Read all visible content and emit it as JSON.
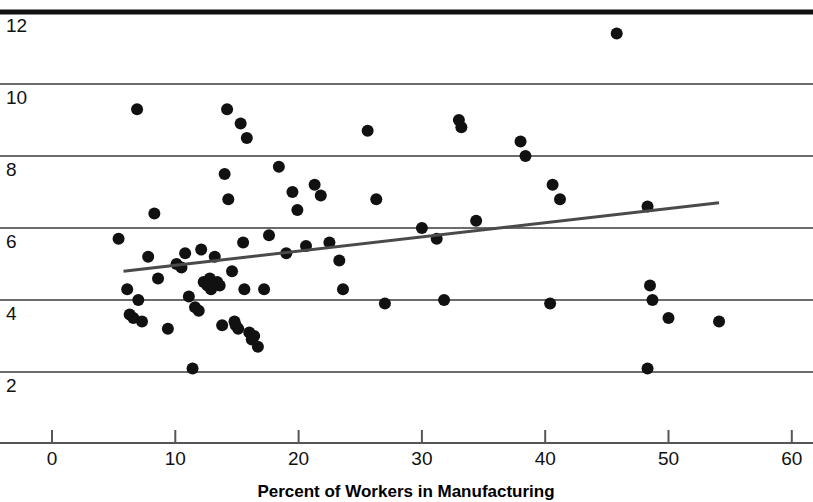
{
  "chart_data": {
    "type": "scatter",
    "title": "",
    "xlabel": "Percent of Workers in Manufacturing",
    "ylabel": "",
    "xlim": [
      -4.2,
      61.9
    ],
    "ylim": [
      1.0,
      12.4
    ],
    "xticks": [
      0,
      10,
      20,
      30,
      40,
      50,
      60
    ],
    "xtick_labels": [
      "0",
      "10",
      "20",
      "30",
      "40",
      "50",
      "60"
    ],
    "yticks": [
      2,
      4,
      6,
      8,
      10,
      12
    ],
    "ytick_labels": [
      "2",
      "4",
      "6",
      "8",
      "10",
      "12"
    ],
    "grid": "horizontal",
    "legend": "none",
    "points": [
      [
        5.4,
        5.7
      ],
      [
        6.1,
        4.3
      ],
      [
        6.3,
        3.6
      ],
      [
        6.6,
        3.5
      ],
      [
        6.9,
        9.3
      ],
      [
        7.0,
        4.0
      ],
      [
        7.3,
        3.4
      ],
      [
        7.8,
        5.2
      ],
      [
        8.3,
        6.4
      ],
      [
        8.6,
        4.6
      ],
      [
        9.4,
        3.2
      ],
      [
        10.1,
        5.0
      ],
      [
        10.5,
        4.9
      ],
      [
        10.8,
        5.3
      ],
      [
        11.1,
        4.1
      ],
      [
        11.4,
        2.1
      ],
      [
        11.6,
        3.8
      ],
      [
        11.9,
        3.7
      ],
      [
        12.1,
        5.4
      ],
      [
        12.3,
        4.5
      ],
      [
        12.6,
        4.4
      ],
      [
        12.8,
        4.6
      ],
      [
        12.9,
        4.3
      ],
      [
        13.2,
        5.2
      ],
      [
        13.4,
        4.5
      ],
      [
        13.6,
        4.4
      ],
      [
        13.8,
        3.3
      ],
      [
        14.0,
        7.5
      ],
      [
        14.2,
        9.3
      ],
      [
        14.3,
        6.8
      ],
      [
        14.6,
        4.8
      ],
      [
        14.8,
        3.4
      ],
      [
        14.9,
        3.3
      ],
      [
        15.1,
        3.2
      ],
      [
        15.3,
        8.9
      ],
      [
        15.5,
        5.6
      ],
      [
        15.6,
        4.3
      ],
      [
        15.8,
        8.5
      ],
      [
        16.0,
        3.1
      ],
      [
        16.2,
        2.9
      ],
      [
        16.4,
        3.0
      ],
      [
        16.7,
        2.7
      ],
      [
        17.2,
        4.3
      ],
      [
        17.6,
        5.8
      ],
      [
        18.4,
        7.7
      ],
      [
        19.0,
        5.3
      ],
      [
        19.5,
        7.0
      ],
      [
        19.9,
        6.5
      ],
      [
        20.6,
        5.5
      ],
      [
        21.3,
        7.2
      ],
      [
        21.8,
        6.9
      ],
      [
        22.5,
        5.6
      ],
      [
        23.3,
        5.1
      ],
      [
        23.6,
        4.3
      ],
      [
        25.6,
        8.7
      ],
      [
        26.3,
        6.8
      ],
      [
        27.0,
        3.9
      ],
      [
        30.0,
        6.0
      ],
      [
        31.2,
        5.7
      ],
      [
        31.8,
        4.0
      ],
      [
        33.0,
        9.0
      ],
      [
        33.2,
        8.8
      ],
      [
        34.4,
        6.2
      ],
      [
        38.0,
        8.4
      ],
      [
        38.4,
        8.0
      ],
      [
        40.4,
        3.9
      ],
      [
        40.6,
        7.2
      ],
      [
        41.2,
        6.8
      ],
      [
        45.8,
        11.4
      ],
      [
        48.3,
        6.6
      ],
      [
        48.5,
        4.4
      ],
      [
        48.7,
        4.0
      ],
      [
        48.3,
        2.1
      ],
      [
        50.0,
        3.5
      ],
      [
        54.1,
        3.4
      ]
    ],
    "trend_line": {
      "x0": 5.8,
      "y0": 4.8,
      "x1": 54.1,
      "y1": 6.7
    }
  },
  "style": {
    "point_color": "#111111",
    "grid_color": "#3a3a3a",
    "top_bar_color": "#111111",
    "axis_color": "#555555",
    "background": "#ffffff"
  }
}
